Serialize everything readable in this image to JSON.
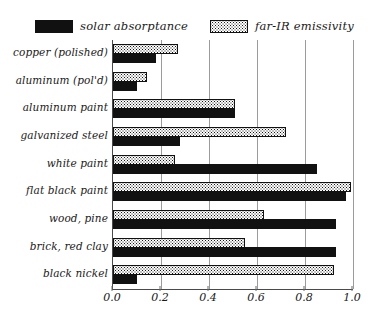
{
  "legend": {
    "items": [
      {
        "label": "solar absorptance",
        "swatch": "solid-black-swatch",
        "color": "#111111"
      },
      {
        "label": "far-IR emissivity",
        "swatch": "stippled-swatch",
        "color": "#f5f5f5"
      }
    ]
  },
  "axis": {
    "ticks": [
      "0.0",
      "0.2",
      "0.4",
      "0.6",
      "0.8",
      "1.0"
    ],
    "tick_values": [
      0.0,
      0.2,
      0.4,
      0.6,
      0.8,
      1.0
    ]
  },
  "chart_data": {
    "type": "bar",
    "orientation": "horizontal",
    "title": "",
    "xlabel": "",
    "ylabel": "",
    "xlim": [
      0.0,
      1.0
    ],
    "grid": true,
    "legend_position": "top",
    "categories": [
      "copper (polished)",
      "aluminum (pol'd)",
      "aluminum paint",
      "galvanized steel",
      "white paint",
      "flat black paint",
      "wood, pine",
      "brick, red clay",
      "black nickel"
    ],
    "series": [
      {
        "name": "solar absorptance",
        "values": [
          0.18,
          0.1,
          0.51,
          0.28,
          0.85,
          0.97,
          0.93,
          0.93,
          0.1
        ]
      },
      {
        "name": "far-IR emissivity",
        "values": [
          0.27,
          0.14,
          0.51,
          0.72,
          0.26,
          0.99,
          0.63,
          0.55,
          0.92
        ]
      }
    ]
  }
}
